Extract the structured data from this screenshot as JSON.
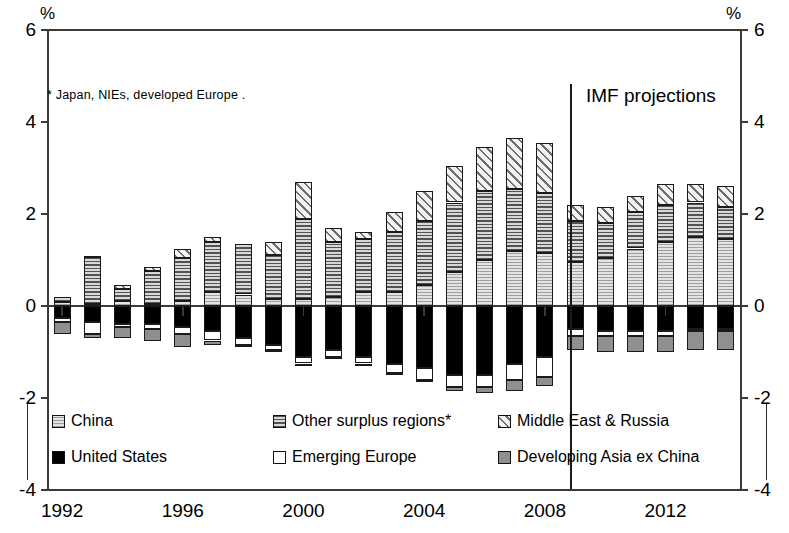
{
  "axis": {
    "unit_label_left": "%",
    "unit_label_right": "%",
    "y_ticks": [
      "6",
      "4",
      "2",
      "0",
      "-2",
      "-4"
    ],
    "y_ticks_right": [
      "6",
      "4",
      "2",
      "0",
      "-2",
      "-4"
    ],
    "x_ticks": [
      "1992",
      "1996",
      "2000",
      "2004",
      "2008",
      "2012"
    ],
    "ymin": -4,
    "ymax": 6
  },
  "annotations": {
    "footnote": "* Japan, NIEs, developed Europe .",
    "projection_label": "IMF projections"
  },
  "legend": {
    "items": [
      {
        "label": "China",
        "key": "china",
        "swatch": "light-grey-hatched"
      },
      {
        "label": "Other surplus regions*",
        "key": "other",
        "swatch": "dense-horizontal-hatch"
      },
      {
        "label": "Middle East & Russia",
        "key": "middle_east_russia",
        "swatch": "diagonal-hatch"
      },
      {
        "label": "United States",
        "key": "united_states",
        "swatch": "solid-black"
      },
      {
        "label": "Emerging Europe",
        "key": "emerging_europe",
        "swatch": "white"
      },
      {
        "label": "Developing Asia ex China",
        "key": "developing_asia",
        "swatch": "mid-grey"
      }
    ]
  },
  "chart_data": {
    "type": "bar",
    "stacked": true,
    "title": "",
    "xlabel": "",
    "ylabel": "%",
    "ylim": [
      -4,
      6
    ],
    "grid": false,
    "legend_position": "bottom",
    "projection_starts_at": "2009",
    "categories": [
      "1992",
      "1993",
      "1994",
      "1995",
      "1996",
      "1997",
      "1998",
      "1999",
      "2000",
      "2001",
      "2002",
      "2003",
      "2004",
      "2005",
      "2006",
      "2007",
      "2008",
      "2009",
      "2010",
      "2011",
      "2012",
      "2013",
      "2014"
    ],
    "series": [
      {
        "name": "China",
        "key": "china",
        "fill": "f-china",
        "values": [
          0.08,
          0.05,
          0.1,
          0.05,
          0.1,
          0.3,
          0.25,
          0.15,
          0.15,
          0.2,
          0.3,
          0.3,
          0.45,
          0.75,
          1.0,
          1.2,
          1.15,
          0.95,
          1.05,
          1.25,
          1.4,
          1.5,
          1.45
        ]
      },
      {
        "name": "Other surplus regions*",
        "key": "other",
        "fill": "f-other",
        "values": [
          0.12,
          1.02,
          0.28,
          0.72,
          0.95,
          1.1,
          1.1,
          0.95,
          1.75,
          1.2,
          1.15,
          1.3,
          1.4,
          1.5,
          1.5,
          1.35,
          1.3,
          0.9,
          0.75,
          0.8,
          0.8,
          0.75,
          0.7
        ]
      },
      {
        "name": "Middle East & Russia",
        "key": "middle_east_russia",
        "fill": "f-me",
        "values": [
          0.0,
          0.02,
          0.08,
          0.08,
          0.2,
          0.1,
          0.0,
          0.3,
          0.8,
          0.3,
          0.15,
          0.45,
          0.65,
          0.8,
          0.95,
          1.1,
          1.1,
          0.35,
          0.35,
          0.35,
          0.45,
          0.4,
          0.45
        ]
      },
      {
        "name": "United States",
        "key": "united_states",
        "fill": "f-us",
        "values": [
          -0.25,
          -0.35,
          -0.4,
          -0.4,
          -0.45,
          -0.55,
          -0.7,
          -0.85,
          -1.1,
          -0.95,
          -1.1,
          -1.25,
          -1.35,
          -1.5,
          -1.5,
          -1.25,
          -1.1,
          -0.5,
          -0.55,
          -0.55,
          -0.55,
          -0.5,
          -0.5
        ]
      },
      {
        "name": "Emerging Europe",
        "key": "emerging_europe",
        "fill": "f-emerging",
        "values": [
          -0.1,
          -0.25,
          -0.05,
          -0.1,
          -0.15,
          -0.2,
          -0.15,
          -0.1,
          -0.15,
          -0.15,
          -0.15,
          -0.2,
          -0.25,
          -0.25,
          -0.25,
          -0.35,
          -0.45,
          -0.15,
          -0.1,
          -0.1,
          -0.1,
          -0.05,
          -0.05
        ]
      },
      {
        "name": "Developing Asia ex China",
        "key": "developing_asia",
        "fill": "f-devasia",
        "values": [
          -0.25,
          -0.1,
          -0.25,
          -0.25,
          -0.3,
          -0.1,
          -0.05,
          -0.05,
          -0.05,
          -0.05,
          -0.05,
          -0.05,
          -0.05,
          -0.1,
          -0.15,
          -0.25,
          -0.2,
          -0.3,
          -0.35,
          -0.35,
          -0.35,
          -0.4,
          -0.4
        ]
      }
    ]
  }
}
